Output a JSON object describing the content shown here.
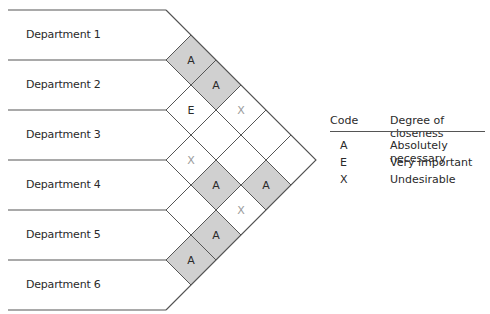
{
  "departments": [
    "Department 1",
    "Department 2",
    "Department 3",
    "Department 4",
    "Department 5",
    "Department 6"
  ],
  "colors": {
    "line": "#555555",
    "shaded_fill": "#d0d0d0",
    "text": "#2a2a2a",
    "x_text": "#9a9a9a"
  },
  "matrix": [
    {
      "pair": [
        1,
        2
      ],
      "code": "A",
      "shaded": true
    },
    {
      "pair": [
        1,
        3
      ],
      "code": "A",
      "shaded": true
    },
    {
      "pair": [
        1,
        4
      ],
      "code": "X",
      "shaded": false
    },
    {
      "pair": [
        1,
        5
      ],
      "code": "",
      "shaded": false
    },
    {
      "pair": [
        1,
        6
      ],
      "code": "",
      "shaded": false
    },
    {
      "pair": [
        2,
        3
      ],
      "code": "E",
      "shaded": false
    },
    {
      "pair": [
        2,
        4
      ],
      "code": "",
      "shaded": false
    },
    {
      "pair": [
        2,
        5
      ],
      "code": "",
      "shaded": false
    },
    {
      "pair": [
        2,
        6
      ],
      "code": "A",
      "shaded": true
    },
    {
      "pair": [
        3,
        4
      ],
      "code": "X",
      "shaded": false
    },
    {
      "pair": [
        3,
        5
      ],
      "code": "A",
      "shaded": true
    },
    {
      "pair": [
        3,
        6
      ],
      "code": "X",
      "shaded": false
    },
    {
      "pair": [
        4,
        5
      ],
      "code": "",
      "shaded": false
    },
    {
      "pair": [
        4,
        6
      ],
      "code": "A",
      "shaded": true
    },
    {
      "pair": [
        5,
        6
      ],
      "code": "A",
      "shaded": true
    }
  ],
  "legend": {
    "header_code": "Code",
    "header_desc": "Degree of closeness",
    "rows": [
      {
        "code": "A",
        "desc": "Absolutely necessary"
      },
      {
        "code": "E",
        "desc": "Very important"
      },
      {
        "code": "X",
        "desc": "Undesirable"
      }
    ]
  }
}
